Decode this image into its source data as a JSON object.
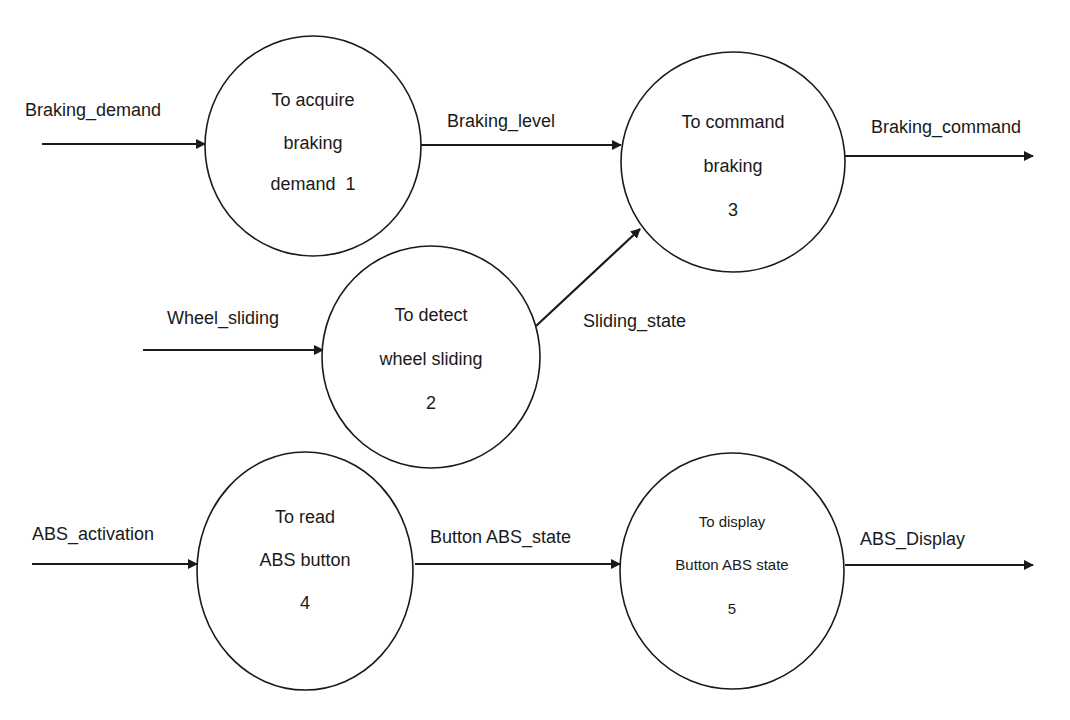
{
  "diagram": {
    "type": "data-flow-diagram",
    "colors": {
      "stroke": "#1a1a1a",
      "background": "#ffffff",
      "text": "#1a1a1a"
    },
    "processes": [
      {
        "id": "1",
        "lines": [
          "To acquire",
          "braking",
          "demand  1"
        ]
      },
      {
        "id": "2",
        "lines": [
          "To detect",
          "wheel sliding",
          "2"
        ]
      },
      {
        "id": "3",
        "lines": [
          "To command",
          "braking",
          "3"
        ]
      },
      {
        "id": "4",
        "lines": [
          "To read",
          "ABS button",
          "4"
        ]
      },
      {
        "id": "5",
        "lines": [
          "To display",
          "Button ABS state",
          "5"
        ]
      }
    ],
    "flows": [
      {
        "label": "Braking_demand",
        "from": "external",
        "to": "1"
      },
      {
        "label": "Braking_level",
        "from": "1",
        "to": "3"
      },
      {
        "label": "Braking_command",
        "from": "3",
        "to": "external"
      },
      {
        "label": "Wheel_sliding",
        "from": "external",
        "to": "2"
      },
      {
        "label": "Sliding_state",
        "from": "2",
        "to": "3"
      },
      {
        "label": "ABS_activation",
        "from": "external",
        "to": "4"
      },
      {
        "label": "Button ABS_state",
        "from": "4",
        "to": "5"
      },
      {
        "label": "ABS_Display",
        "from": "5",
        "to": "external"
      }
    ]
  }
}
